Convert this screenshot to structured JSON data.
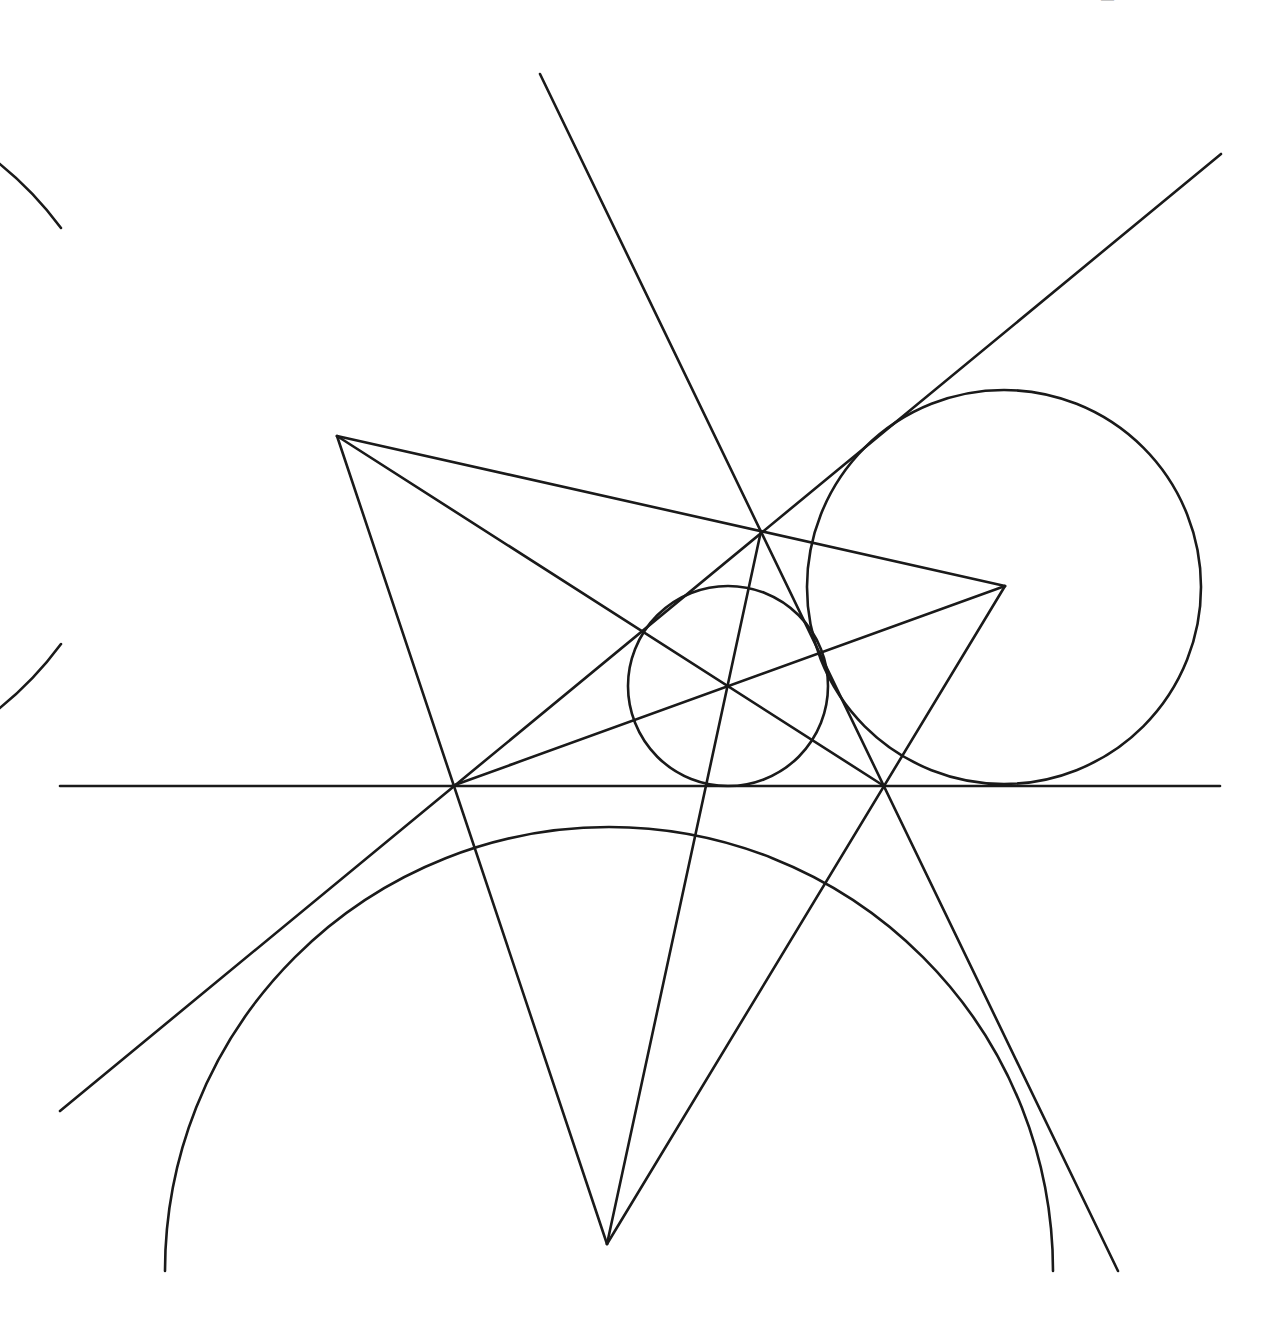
{
  "diagram": {
    "title": "",
    "caption_clipped": "— ········ ········· ·· ·",
    "stroke_color": "#1a1a1a",
    "background": "#ffffff",
    "stroke_width": 2.6,
    "triangle": {
      "vertices": {
        "A": [
          337,
          436
        ],
        "B": [
          1005,
          586
        ],
        "C": [
          607,
          1244
        ]
      }
    },
    "points": {
      "R": [
        761,
        531
      ],
      "P": [
        452,
        786
      ],
      "Q": [
        884,
        786
      ],
      "I": [
        728,
        686
      ]
    },
    "lines": [
      {
        "name": "horizontal-tangent-line",
        "from": [
          60,
          786
        ],
        "to": [
          1220,
          786
        ]
      },
      {
        "name": "steep-tangent-line",
        "from": [
          540,
          74
        ],
        "to": [
          1118,
          1271
        ]
      },
      {
        "name": "diagonal-tangent-line",
        "from": [
          60,
          1111
        ],
        "to": [
          1221,
          154
        ]
      }
    ],
    "segments": [
      {
        "name": "side-AB",
        "from": [
          337,
          436
        ],
        "to": [
          1005,
          586
        ]
      },
      {
        "name": "side-AC",
        "from": [
          337,
          436
        ],
        "to": [
          607,
          1244
        ]
      },
      {
        "name": "side-BC",
        "from": [
          1005,
          586
        ],
        "to": [
          607,
          1244
        ]
      },
      {
        "name": "cevian-A-Q",
        "from": [
          337,
          436
        ],
        "to": [
          884,
          786
        ]
      },
      {
        "name": "cevian-B-P",
        "from": [
          1005,
          586
        ],
        "to": [
          452,
          786
        ]
      },
      {
        "name": "cevian-C-R",
        "from": [
          607,
          1244
        ],
        "to": [
          761,
          531
        ]
      }
    ],
    "circles": [
      {
        "name": "incircle",
        "center": [
          728,
          686
        ],
        "r": 100,
        "type": "full"
      },
      {
        "name": "excircle-right",
        "center": [
          1004,
          587
        ],
        "r": 197,
        "type": "full"
      },
      {
        "name": "excircle-upper-left",
        "center": [
          337,
          436
        ],
        "r": 350,
        "type": "arc",
        "arc_from": [
          61,
          644
        ],
        "arc_to": [
          61,
          228
        ],
        "large": 1,
        "sweep": 1
      },
      {
        "name": "excircle-bottom",
        "center": [
          609,
          1230
        ],
        "r": 444,
        "type": "arc",
        "arc_from": [
          165,
          1271
        ],
        "arc_to": [
          1053,
          1271
        ],
        "large": 1,
        "sweep": 1
      }
    ]
  }
}
